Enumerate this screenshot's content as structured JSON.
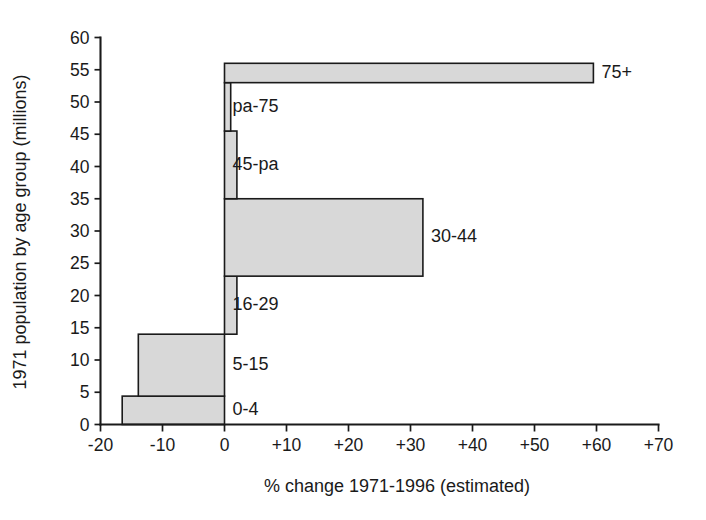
{
  "chart_data": {
    "type": "bar",
    "orientation": "horizontal",
    "title": "",
    "xlabel": "% change 1971-1996 (estimated)",
    "ylabel": "1971 population by age group (millions)",
    "xlim": [
      -20,
      70
    ],
    "ylim": [
      0,
      60
    ],
    "grid": false,
    "legend": null,
    "xticks": [
      "-20",
      "-10",
      "0",
      "+10",
      "+20",
      "+30",
      "+40",
      "+50",
      "+60",
      "+70"
    ],
    "xtick_values": [
      -20,
      -10,
      0,
      10,
      20,
      30,
      40,
      50,
      60,
      70
    ],
    "yticks": [
      "0",
      "5",
      "10",
      "15",
      "20",
      "25",
      "30",
      "35",
      "40",
      "45",
      "50",
      "55",
      "60"
    ],
    "ytick_values": [
      0,
      5,
      10,
      15,
      20,
      25,
      30,
      35,
      40,
      45,
      50,
      55,
      60
    ],
    "note": "Each bar is stacked cumulatively on the y axis: bar thickness = 1971 population (millions) of that age group; bar length = % change 1971-1996.",
    "categories": [
      "0-4",
      "5-15",
      "16-29",
      "30-44",
      "45-pa",
      "pa-75",
      "75+"
    ],
    "bars": [
      {
        "label": "0-4",
        "pop_from": 0.0,
        "pop_to": 4.4,
        "population": 4.4,
        "pct_change": -16.5
      },
      {
        "label": "5-15",
        "pop_from": 4.4,
        "pop_to": 14.0,
        "population": 9.6,
        "pct_change": -13.9
      },
      {
        "label": "16-29",
        "pop_from": 14.0,
        "pop_to": 23.0,
        "population": 9.0,
        "pct_change": 2.0
      },
      {
        "label": "30-44",
        "pop_from": 23.0,
        "pop_to": 35.0,
        "population": 12.0,
        "pct_change": 32.0
      },
      {
        "label": "45-pa",
        "pop_from": 35.0,
        "pop_to": 45.5,
        "population": 10.5,
        "pct_change": 2.0
      },
      {
        "label": "pa-75",
        "pop_from": 45.5,
        "pop_to": 53.0,
        "population": 7.5,
        "pct_change": 1.0
      },
      {
        "label": "75+",
        "pop_from": 53.0,
        "pop_to": 56.0,
        "population": 3.0,
        "pct_change": 59.5
      }
    ],
    "values": [
      -16.5,
      -13.9,
      2.0,
      32.0,
      2.0,
      1.0,
      59.5
    ],
    "colors": {
      "bar_fill": "#d8d8d8",
      "bar_stroke": "#1a1a1a",
      "axis": "#1a1a1a",
      "background": "#ffffff",
      "text": "#1a1a1a"
    }
  }
}
